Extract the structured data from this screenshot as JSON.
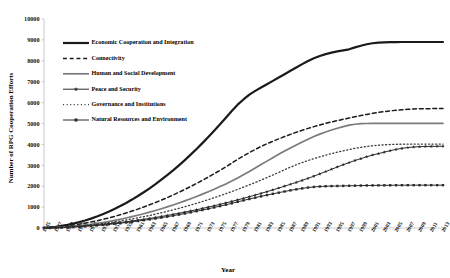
{
  "chart_data": {
    "type": "line",
    "title": "",
    "xlabel": "Year",
    "ylabel": "Number of RPG Cooperation Efforts",
    "ylim": [
      0,
      10000
    ],
    "ytick_step": 1000,
    "yticks": [
      "0",
      "1000",
      "2000",
      "3000",
      "4000",
      "5000",
      "6000",
      "7000",
      "8000",
      "9000",
      "10000"
    ],
    "xlim": [
      1945,
      2013
    ],
    "xtick_step": 2,
    "grid": false,
    "legend_position": "upper-left-inside",
    "x": [
      1945,
      1946,
      1947,
      1948,
      1949,
      1950,
      1951,
      1952,
      1953,
      1954,
      1955,
      1956,
      1957,
      1958,
      1959,
      1960,
      1961,
      1962,
      1963,
      1964,
      1965,
      1966,
      1967,
      1968,
      1969,
      1970,
      1971,
      1972,
      1973,
      1974,
      1975,
      1976,
      1977,
      1978,
      1979,
      1980,
      1981,
      1982,
      1983,
      1984,
      1985,
      1986,
      1987,
      1988,
      1989,
      1990,
      1991,
      1992,
      1993,
      1994,
      1995,
      1996,
      1997,
      1998,
      1999,
      2000,
      2001,
      2002,
      2003,
      2004,
      2005,
      2006,
      2007,
      2008,
      2009,
      2010,
      2011,
      2012,
      2013
    ],
    "xticks": [
      "1945",
      "1947",
      "1949",
      "1951",
      "1953",
      "1955",
      "1957",
      "1959",
      "1961",
      "1963",
      "1965",
      "1967",
      "1969",
      "1971",
      "1973",
      "1975",
      "1977",
      "1979",
      "1981",
      "1983",
      "1985",
      "1987",
      "1989",
      "1991",
      "1993",
      "1995",
      "1997",
      "1999",
      "2001",
      "2003",
      "2005",
      "2007",
      "2009",
      "2011",
      "2013"
    ],
    "series": [
      {
        "name": "Economic Cooperation and Integration",
        "style": "solid",
        "width": 2.2,
        "color": "#1a1a1a",
        "marker": "none",
        "values": [
          10,
          30,
          60,
          100,
          150,
          210,
          280,
          360,
          450,
          550,
          660,
          780,
          910,
          1050,
          1200,
          1360,
          1530,
          1710,
          1900,
          2100,
          2310,
          2530,
          2760,
          3000,
          3250,
          3510,
          3780,
          4060,
          4350,
          4650,
          4960,
          5280,
          5600,
          5900,
          6150,
          6380,
          6560,
          6720,
          6880,
          7040,
          7200,
          7360,
          7520,
          7680,
          7840,
          7990,
          8120,
          8230,
          8320,
          8390,
          8450,
          8500,
          8550,
          8640,
          8720,
          8790,
          8840,
          8870,
          8885,
          8890,
          8895,
          8900,
          8900,
          8900,
          8900,
          8900,
          8900,
          8900,
          8900
        ]
      },
      {
        "name": "Connectivity",
        "style": "dashed",
        "width": 1.5,
        "color": "#1a1a1a",
        "marker": "none",
        "values": [
          5,
          18,
          38,
          65,
          98,
          136,
          180,
          230,
          285,
          345,
          410,
          480,
          555,
          635,
          720,
          810,
          905,
          1005,
          1110,
          1220,
          1335,
          1455,
          1580,
          1710,
          1845,
          1985,
          2130,
          2280,
          2435,
          2595,
          2760,
          2930,
          3105,
          3280,
          3450,
          3610,
          3760,
          3900,
          4030,
          4150,
          4265,
          4375,
          4480,
          4580,
          4675,
          4765,
          4850,
          4930,
          5005,
          5075,
          5140,
          5200,
          5260,
          5320,
          5380,
          5435,
          5485,
          5530,
          5570,
          5605,
          5635,
          5660,
          5680,
          5695,
          5705,
          5710,
          5712,
          5714,
          5715
        ]
      },
      {
        "name": "Human and Social Development",
        "style": "solid",
        "width": 1.7,
        "color": "#7a7a7a",
        "marker": "none",
        "values": [
          3,
          10,
          22,
          38,
          58,
          82,
          110,
          142,
          178,
          218,
          262,
          310,
          362,
          418,
          478,
          542,
          610,
          682,
          758,
          838,
          922,
          1010,
          1102,
          1198,
          1298,
          1402,
          1510,
          1622,
          1738,
          1858,
          1982,
          2110,
          2245,
          2390,
          2545,
          2705,
          2870,
          3035,
          3200,
          3365,
          3525,
          3680,
          3830,
          3975,
          4115,
          4250,
          4375,
          4490,
          4595,
          4690,
          4775,
          4850,
          4920,
          4965,
          4990,
          5000,
          5005,
          5008,
          5010,
          5010,
          5010,
          5010,
          5010,
          5010,
          5010,
          5010,
          5010,
          5010,
          5010
        ]
      },
      {
        "name": "Peace and Security",
        "style": "solid-marker",
        "width": 1.0,
        "color": "#2b2b2b",
        "marker": "star",
        "values": [
          2,
          7,
          15,
          26,
          40,
          56,
          75,
          96,
          119,
          144,
          171,
          200,
          231,
          264,
          299,
          336,
          375,
          416,
          459,
          504,
          551,
          600,
          651,
          704,
          759,
          816,
          875,
          936,
          999,
          1064,
          1131,
          1200,
          1271,
          1344,
          1419,
          1496,
          1575,
          1656,
          1739,
          1824,
          1911,
          2000,
          2091,
          2184,
          2279,
          2376,
          2480,
          2590,
          2700,
          2810,
          2920,
          3030,
          3130,
          3230,
          3320,
          3410,
          3490,
          3560,
          3630,
          3700,
          3760,
          3810,
          3850,
          3875,
          3890,
          3900,
          3905,
          3908,
          3910
        ]
      },
      {
        "name": "Governance and Institutions",
        "style": "dotted",
        "width": 1.3,
        "color": "#3a3a3a",
        "marker": "none",
        "values": [
          2,
          8,
          18,
          32,
          49,
          69,
          92,
          118,
          147,
          179,
          214,
          252,
          293,
          337,
          384,
          434,
          487,
          543,
          602,
          664,
          729,
          797,
          868,
          942,
          1019,
          1099,
          1182,
          1268,
          1357,
          1449,
          1544,
          1642,
          1743,
          1847,
          1954,
          2064,
          2177,
          2293,
          2412,
          2534,
          2659,
          2787,
          2910,
          3025,
          3130,
          3230,
          3320,
          3405,
          3485,
          3560,
          3630,
          3695,
          3755,
          3810,
          3860,
          3900,
          3935,
          3960,
          3980,
          3995,
          4005,
          4010,
          4012,
          4014,
          4015,
          4015,
          4015,
          4015,
          4015
        ]
      },
      {
        "name": "Natural Resources and Environment",
        "style": "solid-marker",
        "width": 1.0,
        "color": "#2b2b2b",
        "marker": "square",
        "values": [
          1,
          5,
          12,
          21,
          33,
          47,
          63,
          81,
          101,
          123,
          147,
          173,
          201,
          231,
          263,
          297,
          333,
          371,
          411,
          453,
          497,
          543,
          591,
          641,
          693,
          747,
          803,
          861,
          921,
          983,
          1047,
          1113,
          1181,
          1251,
          1320,
          1387,
          1452,
          1515,
          1576,
          1635,
          1692,
          1747,
          1800,
          1850,
          1895,
          1935,
          1965,
          1985,
          1998,
          2005,
          2010,
          2015,
          2020,
          2025,
          2030,
          2035,
          2038,
          2040,
          2042,
          2044,
          2046,
          2048,
          2049,
          2050,
          2050,
          2050,
          2050,
          2050,
          2050
        ]
      }
    ]
  }
}
